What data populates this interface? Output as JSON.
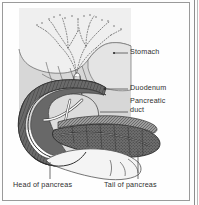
{
  "figure": {
    "frame_color": "#9a9a9a",
    "background_color": "#fefefe",
    "panel_color": "#d9d9d9"
  },
  "labels": {
    "stomach": "Stomach",
    "duodenum": "Duodenum",
    "pancreatic_duct_line1": "Pancreatic",
    "pancreatic_duct_line2": "duct",
    "head_of_pancreas": "Head of pancreas",
    "tail_of_pancreas": "Tail of pancreas"
  },
  "structures": {
    "stomach_fill": "#e9e9e9",
    "duodenum_fill": "#6e6e6e",
    "duodenum_outline": "#3a3a3a",
    "pancreas_fill": "#c9c9c9",
    "pancreas_body_fill": "#7c7c7c",
    "duct_fill": "#fbfbfb",
    "duct_outline": "#4a4a4a",
    "stipple_color": "#5d5d5d"
  },
  "leader_lines": {
    "color": "#4d4d4d",
    "dot_color": "#2b2b2b"
  }
}
